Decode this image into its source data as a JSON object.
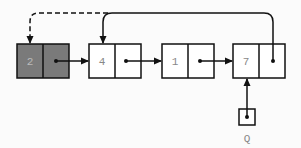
{
  "diagram": {
    "type": "linked-list",
    "nodes": [
      {
        "id": "n0",
        "value": "2",
        "shaded": true
      },
      {
        "id": "n1",
        "value": "4",
        "shaded": false
      },
      {
        "id": "n2",
        "value": "1",
        "shaded": false
      },
      {
        "id": "n3",
        "value": "7",
        "shaded": false
      }
    ],
    "pointer": {
      "label": "Q",
      "target": "n3"
    },
    "edges": [
      {
        "from": "n0",
        "to": "n1",
        "style": "solid"
      },
      {
        "from": "n1",
        "to": "n2",
        "style": "solid"
      },
      {
        "from": "n2",
        "to": "n3",
        "style": "solid"
      },
      {
        "from": "n3",
        "to": "n1",
        "style": "solid",
        "routing": "over-top"
      },
      {
        "from": "top-line",
        "to": "n0",
        "style": "dashed",
        "routing": "over-top"
      },
      {
        "from": "Q",
        "to": "n3",
        "style": "solid"
      }
    ],
    "colors": {
      "shaded": "#7a7a7a",
      "line": "#111111",
      "box_fill": "#ffffff",
      "label": "#888888"
    }
  }
}
